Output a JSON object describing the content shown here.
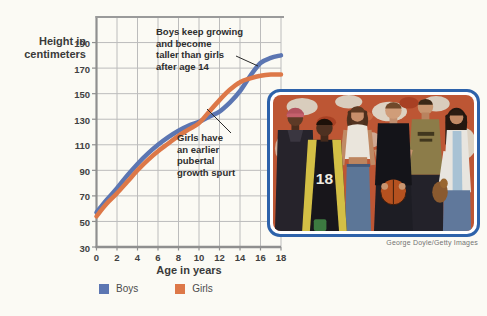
{
  "chart_data": {
    "type": "line",
    "y_axis_title": "Height in centimeters",
    "x_axis_title": "Age in years",
    "xlim": [
      0,
      18
    ],
    "ylim": [
      30,
      210
    ],
    "xticks": [
      0,
      2,
      4,
      6,
      8,
      10,
      12,
      14,
      16,
      18
    ],
    "yticks": [
      30,
      50,
      70,
      90,
      110,
      130,
      150,
      170,
      190
    ],
    "grid": true,
    "x": [
      0,
      1,
      2,
      3,
      4,
      5,
      6,
      7,
      8,
      9,
      10,
      11,
      12,
      13,
      14,
      15,
      16,
      17,
      18
    ],
    "series": [
      {
        "name": "Boys",
        "color": "#5c76b2",
        "values": [
          57,
          67,
          76,
          86,
          95,
          103,
          110,
          116,
          121,
          125,
          128,
          132,
          136,
          143,
          152,
          164,
          174,
          178,
          180
        ]
      },
      {
        "name": "Girls",
        "color": "#dd7848",
        "values": [
          54,
          64,
          72,
          81,
          90,
          98,
          105,
          111,
          117,
          122,
          127,
          136,
          145,
          153,
          159,
          162,
          164,
          165,
          165
        ]
      }
    ],
    "legend_position": "bottom",
    "annotations": [
      {
        "id": "boys-note",
        "text": "Boys keep growing\nand become\ntaller than girls\nafter age 14"
      },
      {
        "id": "girls-note",
        "text": "Girls have\nan earlier\npubertal\ngrowth spurt"
      }
    ]
  },
  "photo": {
    "credit": "George Doyle/Getty Images",
    "jersey_number": "18"
  }
}
